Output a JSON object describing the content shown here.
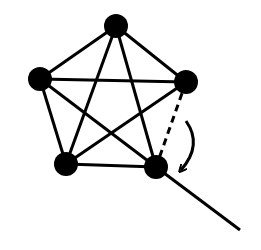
{
  "diagram": {
    "type": "graph",
    "colors": {
      "stroke": "#000000",
      "node": "#000000",
      "background": "#ffffff"
    },
    "nodes": [
      {
        "id": "top",
        "x": 116,
        "y": 26,
        "r": 12
      },
      {
        "id": "left",
        "x": 40,
        "y": 79,
        "r": 12
      },
      {
        "id": "right",
        "x": 186,
        "y": 82,
        "r": 12
      },
      {
        "id": "bottom-left",
        "x": 66,
        "y": 164,
        "r": 12
      },
      {
        "id": "bottom-right",
        "x": 156,
        "y": 167,
        "r": 12
      }
    ],
    "edges": [
      {
        "from": "top",
        "to": "left",
        "style": "solid"
      },
      {
        "from": "top",
        "to": "right",
        "style": "solid"
      },
      {
        "from": "top",
        "to": "bottom-left",
        "style": "solid"
      },
      {
        "from": "top",
        "to": "bottom-right",
        "style": "solid"
      },
      {
        "from": "left",
        "to": "right",
        "style": "solid"
      },
      {
        "from": "left",
        "to": "bottom-left",
        "style": "solid"
      },
      {
        "from": "left",
        "to": "bottom-right",
        "style": "solid"
      },
      {
        "from": "right",
        "to": "bottom-left",
        "style": "solid"
      },
      {
        "from": "right",
        "to": "bottom-right",
        "style": "dashed"
      },
      {
        "from": "bottom-left",
        "to": "bottom-right",
        "style": "solid"
      }
    ],
    "external_line": {
      "from": "bottom-right",
      "x2": 240,
      "y2": 230
    },
    "rotation_arrow": {
      "direction": "clockwise",
      "from": [
        186,
        121
      ],
      "to": [
        181,
        170
      ]
    }
  }
}
